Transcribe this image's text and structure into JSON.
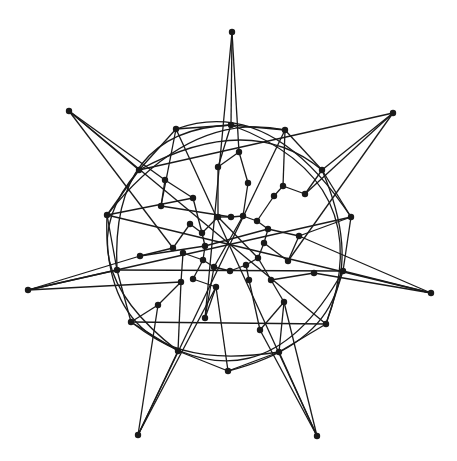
{
  "figure": {
    "type": "graph-drawing",
    "background": "#ffffff",
    "edge_color": "#1a1a1a",
    "node_color": "#1a1a1a",
    "node_radius": 3.2
  },
  "nodes": [
    {
      "id": "o0",
      "x": 232,
      "y": 32
    },
    {
      "id": "o1",
      "x": 393,
      "y": 113
    },
    {
      "id": "o2",
      "x": 431,
      "y": 293
    },
    {
      "id": "o3",
      "x": 317,
      "y": 436
    },
    {
      "id": "o4",
      "x": 138,
      "y": 435
    },
    {
      "id": "o5",
      "x": 28,
      "y": 290
    },
    {
      "id": "o6",
      "x": 69,
      "y": 111
    },
    {
      "id": "m0",
      "x": 231,
      "y": 125
    },
    {
      "id": "m1",
      "x": 285,
      "y": 130
    },
    {
      "id": "m2",
      "x": 322,
      "y": 170
    },
    {
      "id": "m3",
      "x": 351,
      "y": 217
    },
    {
      "id": "m4",
      "x": 343,
      "y": 271
    },
    {
      "id": "m5",
      "x": 326,
      "y": 324
    },
    {
      "id": "m6",
      "x": 279,
      "y": 352
    },
    {
      "id": "m7",
      "x": 228,
      "y": 371
    },
    {
      "id": "m8",
      "x": 178,
      "y": 351
    },
    {
      "id": "m9",
      "x": 131,
      "y": 322
    },
    {
      "id": "m10",
      "x": 117,
      "y": 270
    },
    {
      "id": "m11",
      "x": 107,
      "y": 215
    },
    {
      "id": "m12",
      "x": 139,
      "y": 170
    },
    {
      "id": "m13",
      "x": 176,
      "y": 129
    },
    {
      "id": "p0",
      "x": 239,
      "y": 152
    },
    {
      "id": "p1",
      "x": 305,
      "y": 194
    },
    {
      "id": "p2",
      "x": 283,
      "y": 186
    },
    {
      "id": "p3",
      "x": 299,
      "y": 236
    },
    {
      "id": "p4",
      "x": 314,
      "y": 273
    },
    {
      "id": "p5",
      "x": 288,
      "y": 261
    },
    {
      "id": "p6",
      "x": 260,
      "y": 330
    },
    {
      "id": "p7",
      "x": 284,
      "y": 302
    },
    {
      "id": "p8",
      "x": 205,
      "y": 318
    },
    {
      "id": "p9",
      "x": 216,
      "y": 287
    },
    {
      "id": "p10",
      "x": 158,
      "y": 305
    },
    {
      "id": "p11",
      "x": 181,
      "y": 282
    },
    {
      "id": "p12",
      "x": 140,
      "y": 256
    },
    {
      "id": "p13",
      "x": 173,
      "y": 248
    },
    {
      "id": "p14",
      "x": 161,
      "y": 206
    },
    {
      "id": "p15",
      "x": 165,
      "y": 180
    },
    {
      "id": "p16",
      "x": 218,
      "y": 167
    },
    {
      "id": "p17",
      "x": 193,
      "y": 198
    },
    {
      "id": "c0",
      "x": 218,
      "y": 217
    },
    {
      "id": "c1",
      "x": 231,
      "y": 217
    },
    {
      "id": "c2",
      "x": 243,
      "y": 216
    },
    {
      "id": "c3",
      "x": 257,
      "y": 221
    },
    {
      "id": "c4",
      "x": 268,
      "y": 229
    },
    {
      "id": "c5",
      "x": 264,
      "y": 243
    },
    {
      "id": "c6",
      "x": 258,
      "y": 258
    },
    {
      "id": "c7",
      "x": 246,
      "y": 265
    },
    {
      "id": "c8",
      "x": 230,
      "y": 271
    },
    {
      "id": "c9",
      "x": 214,
      "y": 267
    },
    {
      "id": "c10",
      "x": 203,
      "y": 260
    },
    {
      "id": "c11",
      "x": 205,
      "y": 246
    },
    {
      "id": "c12",
      "x": 202,
      "y": 233
    },
    {
      "id": "c13",
      "x": 193,
      "y": 279
    },
    {
      "id": "c14",
      "x": 274,
      "y": 196
    },
    {
      "id": "c15",
      "x": 248,
      "y": 183
    },
    {
      "id": "c16",
      "x": 190,
      "y": 224
    },
    {
      "id": "c17",
      "x": 271,
      "y": 280
    },
    {
      "id": "c18",
      "x": 249,
      "y": 280
    },
    {
      "id": "c19",
      "x": 183,
      "y": 253
    }
  ],
  "edges": [
    [
      "o0",
      "m0"
    ],
    [
      "o0",
      "p0"
    ],
    [
      "o0",
      "p8"
    ],
    [
      "o1",
      "m2"
    ],
    [
      "o1",
      "p1"
    ],
    [
      "o1",
      "m12"
    ],
    [
      "o1",
      "p5"
    ],
    [
      "o2",
      "m4"
    ],
    [
      "o2",
      "p4"
    ],
    [
      "o2",
      "m11"
    ],
    [
      "o2",
      "p3"
    ],
    [
      "o3",
      "m6"
    ],
    [
      "o3",
      "p6"
    ],
    [
      "o3",
      "m13"
    ],
    [
      "o3",
      "p7"
    ],
    [
      "o4",
      "m8"
    ],
    [
      "o4",
      "p10"
    ],
    [
      "o4",
      "m1"
    ],
    [
      "o4",
      "p9"
    ],
    [
      "o5",
      "m10"
    ],
    [
      "o5",
      "p12"
    ],
    [
      "o5",
      "m3"
    ],
    [
      "o5",
      "p11"
    ],
    [
      "o6",
      "m12"
    ],
    [
      "o6",
      "p15"
    ],
    [
      "o6",
      "m5"
    ],
    [
      "o6",
      "p13"
    ],
    [
      "m0",
      "m1"
    ],
    [
      "m0",
      "p16"
    ],
    [
      "m1",
      "m2"
    ],
    [
      "m1",
      "p2"
    ],
    [
      "m2",
      "m3"
    ],
    [
      "m3",
      "m4"
    ],
    [
      "m4",
      "m5"
    ],
    [
      "m5",
      "m6"
    ],
    [
      "m6",
      "m7"
    ],
    [
      "m7",
      "m8"
    ],
    [
      "m8",
      "m9"
    ],
    [
      "m9",
      "m10"
    ],
    [
      "m10",
      "m11"
    ],
    [
      "m11",
      "m12"
    ],
    [
      "m12",
      "m13"
    ],
    [
      "m13",
      "m0"
    ],
    [
      "m9",
      "m5"
    ],
    [
      "m10",
      "m4"
    ],
    [
      "m13",
      "p14"
    ],
    [
      "m11",
      "p17"
    ],
    [
      "m7",
      "p9"
    ],
    [
      "m6",
      "p7"
    ],
    [
      "m8",
      "p11"
    ],
    [
      "m3",
      "p3"
    ],
    [
      "m2",
      "p1"
    ],
    [
      "m9",
      "p10"
    ],
    [
      "p0",
      "c15"
    ],
    [
      "p0",
      "p16"
    ],
    [
      "p1",
      "p2"
    ],
    [
      "p2",
      "c14"
    ],
    [
      "p3",
      "p5"
    ],
    [
      "p4",
      "c17"
    ],
    [
      "p5",
      "c5"
    ],
    [
      "p6",
      "p7"
    ],
    [
      "p7",
      "c17"
    ],
    [
      "p8",
      "p9"
    ],
    [
      "p9",
      "c13"
    ],
    [
      "p10",
      "p11"
    ],
    [
      "p11",
      "c19"
    ],
    [
      "p12",
      "p13"
    ],
    [
      "p13",
      "c16"
    ],
    [
      "p14",
      "p15"
    ],
    [
      "p15",
      "p17"
    ],
    [
      "p16",
      "c0"
    ],
    [
      "p17",
      "c12"
    ],
    [
      "p6",
      "c18"
    ],
    [
      "p12",
      "c11"
    ],
    [
      "p14",
      "c1"
    ],
    [
      "p3",
      "c4"
    ],
    [
      "p8",
      "c9"
    ],
    [
      "c0",
      "c1"
    ],
    [
      "c1",
      "c2"
    ],
    [
      "c2",
      "c3"
    ],
    [
      "c3",
      "c4"
    ],
    [
      "c4",
      "c5"
    ],
    [
      "c5",
      "c6"
    ],
    [
      "c6",
      "c7"
    ],
    [
      "c7",
      "c8"
    ],
    [
      "c8",
      "c9"
    ],
    [
      "c9",
      "c10"
    ],
    [
      "c10",
      "c11"
    ],
    [
      "c11",
      "c12"
    ],
    [
      "c12",
      "c0"
    ],
    [
      "c14",
      "c3"
    ],
    [
      "c15",
      "c2"
    ],
    [
      "c13",
      "c10"
    ],
    [
      "c18",
      "c7"
    ],
    [
      "c17",
      "c6"
    ],
    [
      "c16",
      "c12"
    ],
    [
      "c19",
      "c10"
    ],
    [
      "c0",
      "c6"
    ],
    [
      "c2",
      "c9"
    ],
    [
      "c4",
      "c11"
    ]
  ],
  "arcs": [
    {
      "from": "m13",
      "to": "m3",
      "cx": 270,
      "cy": 95
    },
    {
      "from": "m0",
      "to": "m5",
      "cx": 380,
      "cy": 180
    },
    {
      "from": "m2",
      "to": "m7",
      "cx": 390,
      "cy": 330
    },
    {
      "from": "m4",
      "to": "m9",
      "cx": 260,
      "cy": 420
    },
    {
      "from": "m6",
      "to": "m11",
      "cx": 100,
      "cy": 380
    },
    {
      "from": "m8",
      "to": "m12",
      "cx": 60,
      "cy": 260
    },
    {
      "from": "m10",
      "to": "m0",
      "cx": 110,
      "cy": 130
    },
    {
      "from": "m11",
      "to": "m1",
      "cx": 190,
      "cy": 110
    },
    {
      "from": "m12",
      "to": "m2",
      "cx": 250,
      "cy": 110
    }
  ]
}
